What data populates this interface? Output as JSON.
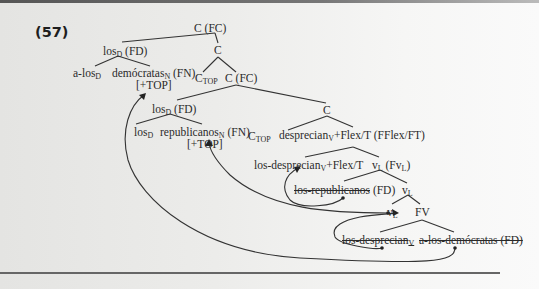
{
  "example_number": "(57)",
  "nodes": {
    "root": {
      "text": "C (FC)"
    },
    "los_fd_1": {
      "base": "los",
      "sub": "D",
      "after": " (FD)"
    },
    "c_1": {
      "text": "C"
    },
    "a_los": {
      "base": "a-los",
      "sub": "D",
      "after": ""
    },
    "democratas": {
      "base": "demócratas",
      "sub": "N",
      "after": " (FN)"
    },
    "top_1": {
      "text": "[+TOP]"
    },
    "ctop_1": {
      "base": "C",
      "sub": "TOP",
      "after": ""
    },
    "c_fc_2": {
      "text": "C (FC)"
    },
    "los_fd_2": {
      "base": "los",
      "sub": "D",
      "after": " (FD)"
    },
    "c_2": {
      "text": "C"
    },
    "los_d": {
      "base": "los",
      "sub": "D",
      "after": ""
    },
    "republicanos": {
      "base": "republicanos",
      "sub": "N",
      "after": " (FN)"
    },
    "top_2": {
      "text": "[+TOP]"
    },
    "ctop_2": {
      "base": "C",
      "sub": "TOP",
      "after": ""
    },
    "desprecian_flex": {
      "base": "desprecian",
      "sub": "V",
      "after": "+Flex/T (FFlex/FT)"
    },
    "los_desprecian_flex": {
      "base": "los-desprecian",
      "sub": "V",
      "after": "+Flex/T"
    },
    "vl_fvl": {
      "base": "v",
      "sub": "L",
      "after": " (Fv",
      "sub2": "L",
      "after2": ")"
    },
    "los_republicanos_trace": {
      "text": "los-republicanos",
      "after": " (FD)"
    },
    "vl_1": {
      "base": "v",
      "sub": "L"
    },
    "vl_2": {
      "base": "v",
      "sub": "L"
    },
    "fv": {
      "text": "FV"
    },
    "los_desprecian_trace": {
      "base": "los-desprecian",
      "sub": "V"
    },
    "a_los_democratas_trace": {
      "text": "a-los-demócratas (FD)"
    }
  },
  "colors": {
    "text": "#2a2a2a",
    "lines": "#333333",
    "rule": "#666666"
  }
}
